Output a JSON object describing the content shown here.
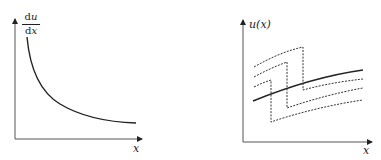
{
  "figures": [
    {
      "id": "left",
      "y_label": {
        "num_d": "d",
        "num_var": "u",
        "den_d": "d",
        "den_var": "x"
      },
      "x_label": "x",
      "description": "Monotonically decreasing derivative curve du/dx vs x"
    },
    {
      "id": "right",
      "y_label": "u(x)",
      "x_label": "x",
      "description": "Solid increasing curve u(x) with three dashed shifted/jumped curves"
    }
  ],
  "colors": {
    "line": "#222222",
    "axis": "#444444",
    "background": "#ffffff"
  }
}
